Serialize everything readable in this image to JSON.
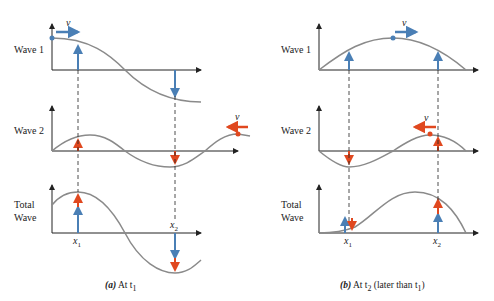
{
  "panel_a": {
    "row_labels": {
      "wave1": "Wave 1",
      "wave2": "Wave 2",
      "total_line1": "Total",
      "total_line2": "Wave"
    },
    "velocity_label": "v",
    "x1_label": "x",
    "x1_sub": "1",
    "x2_label": "x",
    "x2_sub": "2",
    "caption_letter": "(a)",
    "caption_text": "At t",
    "caption_sub": "1"
  },
  "panel_b": {
    "row_labels": {
      "wave1": "Wave 1",
      "wave2": "Wave 2",
      "total_line1": "Total",
      "total_line2": "Wave"
    },
    "velocity_label": "v",
    "x1_label": "x",
    "x1_sub": "1",
    "x2_label": "x",
    "x2_sub": "2",
    "caption_letter": "(b)",
    "caption_text": "At t",
    "caption_sub": "2",
    "caption_tail": " (later than t",
    "caption_tail_sub": "1",
    "caption_close": ")"
  },
  "colors": {
    "wave1": "#4a7fb5",
    "wave2": "#e0481f",
    "curve": "#8a8a8a",
    "axis": "#222222"
  }
}
